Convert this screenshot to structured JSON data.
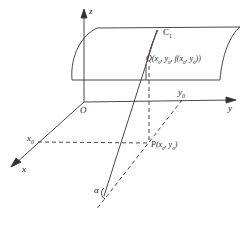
{
  "diagram": {
    "type": "3d-geometry-sketch",
    "axes": {
      "x_label": "x",
      "y_label": "y",
      "z_label": "z",
      "origin_label": "O"
    },
    "points": {
      "x0_label": "x",
      "x0_sub": "0",
      "y0_label": "y",
      "y0_sub": "0",
      "P_label": "P(x",
      "P_sub1": "0",
      "P_mid": ", y",
      "P_sub2": "0",
      "P_end": ")",
      "Q_label": "Q(x",
      "Q_sub1": "0",
      "Q_mid1": ", y",
      "Q_sub2": "0",
      "Q_mid2": ", f(x",
      "Q_sub3": "0",
      "Q_mid3": ", y",
      "Q_sub4": "0",
      "Q_end": "))"
    },
    "curve_label": "C",
    "curve_sub": "1",
    "angle_label": "α",
    "colors": {
      "stroke": "#333333",
      "background": "#ffffff"
    }
  }
}
